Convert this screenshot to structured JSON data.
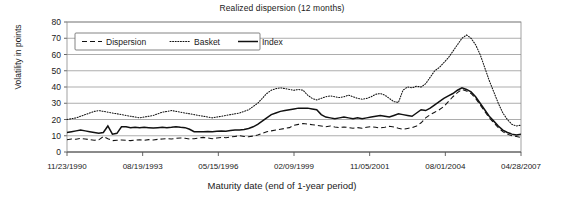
{
  "chart_data": {
    "type": "line",
    "title": "Realized dispersion (12 months)",
    "xlabel": "Maturity date (end of 1-year period)",
    "ylabel": "Volatility in points",
    "ylim": [
      0,
      80
    ],
    "yticks": [
      0,
      10,
      20,
      30,
      40,
      50,
      60,
      70,
      80
    ],
    "xticks": [
      "11/23/1990",
      "08/19/1993",
      "05/15/1996",
      "02/09/1999",
      "11/05/2001",
      "08/01/2004",
      "04/28/2007"
    ],
    "grid": true,
    "legend_position": "top-left",
    "x_index": [
      0,
      1,
      2,
      3,
      4,
      5,
      6,
      7,
      8,
      9,
      10,
      11,
      12,
      13,
      14,
      15,
      16,
      17,
      18,
      19,
      20,
      21,
      22,
      23,
      24,
      25,
      26,
      27,
      28,
      29,
      30,
      31,
      32,
      33,
      34,
      35,
      36,
      37,
      38,
      39,
      40,
      41,
      42,
      43,
      44,
      45,
      46,
      47,
      48,
      49,
      50,
      51,
      52,
      53,
      54,
      55,
      56,
      57,
      58,
      59,
      60,
      61,
      62,
      63,
      64,
      65,
      66,
      67,
      68,
      69,
      70,
      71,
      72,
      73,
      74,
      75,
      76,
      77,
      78,
      79,
      80,
      81,
      82,
      83,
      84,
      85,
      86,
      87,
      88,
      89,
      90,
      91,
      92,
      93,
      94,
      95,
      96,
      97,
      98,
      99,
      100
    ],
    "series": [
      {
        "name": "Dispersion",
        "style": "dashed",
        "values": [
          7.5,
          8.0,
          7.8,
          8.4,
          8.0,
          7.6,
          7.2,
          7.5,
          9.5,
          8.2,
          7.0,
          7.2,
          7.4,
          7.2,
          7.0,
          7.3,
          7.5,
          7.2,
          7.6,
          7.4,
          7.8,
          8.0,
          8.2,
          8.0,
          8.4,
          8.6,
          8.4,
          8.0,
          8.2,
          8.6,
          9.0,
          8.6,
          8.2,
          8.6,
          9.0,
          8.8,
          9.2,
          9.6,
          10.0,
          9.6,
          9.4,
          9.8,
          10.5,
          11.5,
          12.5,
          13.0,
          13.5,
          14.0,
          14.5,
          15.0,
          16.5,
          17.0,
          17.5,
          17.2,
          16.8,
          16.4,
          16.0,
          15.6,
          16.0,
          15.4,
          15.0,
          15.4,
          15.0,
          14.6,
          15.0,
          14.6,
          15.2,
          15.6,
          15.2,
          14.8,
          15.2,
          15.8,
          15.4,
          14.6,
          14.0,
          14.5,
          15.0,
          16.0,
          18.0,
          21.0,
          23.0,
          24.5,
          26.0,
          28.0,
          31.0,
          34.0,
          36.5,
          38.5,
          37.5,
          36.0,
          33.0,
          29.0,
          25.0,
          21.0,
          18.0,
          15.0,
          12.5,
          11.0,
          10.0,
          9.5,
          9.0
        ],
        "annotations": {
          "peak": 38.5,
          "early_level": 7.5,
          "late_level": 9.0
        }
      },
      {
        "name": "Basket",
        "style": "dotted",
        "values": [
          20.0,
          20.5,
          21.0,
          22.0,
          23.0,
          24.0,
          25.0,
          25.5,
          25.0,
          24.5,
          24.0,
          23.5,
          23.0,
          22.5,
          22.0,
          21.5,
          21.0,
          21.5,
          22.0,
          22.5,
          23.5,
          24.5,
          25.0,
          25.5,
          25.0,
          24.5,
          24.0,
          23.5,
          23.0,
          22.5,
          22.0,
          21.5,
          21.0,
          21.5,
          22.0,
          22.5,
          23.0,
          23.5,
          24.0,
          25.0,
          26.0,
          28.0,
          30.0,
          33.0,
          36.0,
          38.0,
          39.0,
          39.5,
          39.0,
          38.5,
          38.0,
          38.5,
          38.0,
          35.0,
          33.0,
          32.0,
          33.0,
          34.0,
          34.5,
          34.0,
          33.5,
          34.0,
          35.0,
          34.0,
          33.0,
          32.5,
          33.0,
          34.0,
          35.5,
          36.0,
          35.0,
          33.0,
          31.0,
          30.5,
          38.0,
          40.0,
          39.5,
          40.5,
          40.0,
          42.0,
          46.0,
          50.0,
          52.0,
          55.0,
          58.0,
          62.0,
          66.0,
          70.0,
          72.0,
          70.0,
          66.0,
          60.0,
          52.0,
          44.0,
          37.0,
          30.0,
          24.0,
          20.0,
          17.0,
          16.0,
          16.5
        ],
        "annotations": {
          "peak": 72.0,
          "early_level": 20.0,
          "late_level": 16.5
        }
      },
      {
        "name": "Index",
        "style": "solid",
        "values": [
          12.0,
          12.5,
          13.0,
          13.5,
          13.0,
          12.5,
          12.0,
          11.5,
          12.0,
          16.0,
          11.0,
          11.5,
          15.5,
          15.5,
          15.0,
          15.2,
          15.0,
          15.2,
          15.0,
          14.8,
          15.0,
          15.2,
          15.0,
          15.2,
          15.5,
          15.2,
          15.0,
          14.0,
          12.5,
          12.5,
          12.5,
          12.6,
          12.5,
          12.8,
          13.0,
          12.8,
          13.2,
          13.5,
          13.5,
          13.8,
          14.5,
          15.5,
          17.0,
          19.0,
          21.0,
          23.0,
          24.0,
          25.0,
          25.5,
          26.0,
          26.5,
          27.0,
          27.0,
          27.0,
          26.5,
          26.0,
          23.0,
          21.5,
          21.0,
          20.5,
          21.0,
          21.5,
          21.0,
          20.5,
          21.0,
          20.5,
          21.0,
          21.5,
          22.0,
          22.5,
          22.0,
          21.5,
          22.5,
          23.5,
          23.0,
          22.5,
          22.0,
          24.0,
          26.0,
          25.5,
          27.0,
          29.0,
          31.0,
          33.0,
          34.5,
          36.0,
          38.0,
          39.5,
          38.5,
          37.0,
          34.0,
          30.0,
          26.0,
          22.0,
          19.0,
          16.0,
          13.5,
          12.0,
          11.0,
          10.5,
          11.0
        ],
        "annotations": {
          "peak": 39.5,
          "early_level": 12.0,
          "late_level": 11.0
        }
      }
    ]
  },
  "legend": {
    "items": [
      {
        "label": "Dispersion",
        "style": "dashed"
      },
      {
        "label": "Basket",
        "style": "dotted"
      },
      {
        "label": "Index",
        "style": "solid"
      }
    ]
  },
  "colors": {
    "series_stroke": "#111111",
    "grid": "#8a8a8a",
    "background": "#ffffff"
  }
}
